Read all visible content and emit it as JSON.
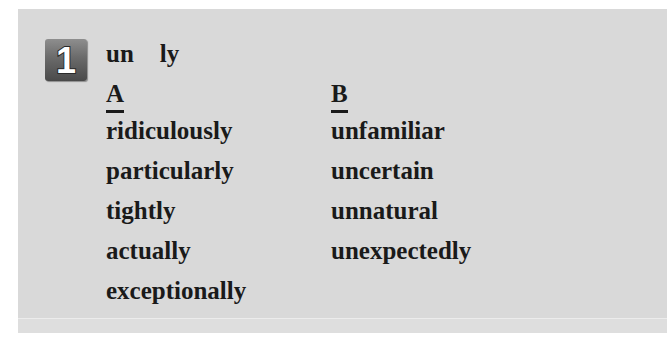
{
  "exercise": {
    "number": "1",
    "prompt": {
      "prefix": "un",
      "suffix": "ly"
    },
    "columns": [
      {
        "heading": "A",
        "words": [
          "ridiculously",
          "particularly",
          "tightly",
          "actually",
          "exceptionally"
        ]
      },
      {
        "heading": "B",
        "words": [
          "unfamiliar",
          "uncertain",
          "unnatural",
          "unexpectedly"
        ]
      }
    ]
  },
  "colors": {
    "panel_background": "#d9d9d9",
    "text": "#1a1a1a",
    "badge_dark": "#4a4a4a",
    "badge_light": "#8e8e8e"
  }
}
